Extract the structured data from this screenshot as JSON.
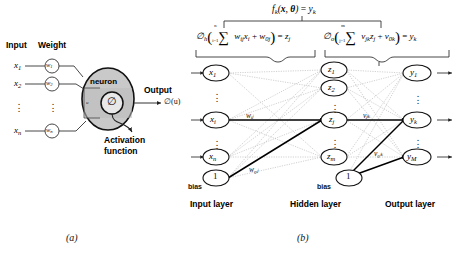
{
  "figure": {
    "panel_a": {
      "caption": "(a)",
      "headers": {
        "input": "Input",
        "weight": "Weight"
      },
      "inputs": [
        {
          "label": "x",
          "sub": "1"
        },
        {
          "label": "x",
          "sub": "2"
        },
        {
          "label": "x",
          "sub": "n"
        }
      ],
      "weights": [
        {
          "label": "w",
          "sub": "1"
        },
        {
          "label": "w",
          "sub": "2"
        },
        {
          "label": "w",
          "sub": "n"
        }
      ],
      "neuron_label": "neuron",
      "sum_symbol": "u",
      "activation_symbol": "∅",
      "output_header": "Output",
      "output_expr": "∅(u)",
      "activation_caption_line1": "Activation",
      "activation_caption_line2": "function",
      "vertical_dots": "⋮"
    },
    "panel_b": {
      "caption": "(b)",
      "top_formula": "fₖ(x, θ) = yₖ",
      "hidden_formula": "∅ₕ( Σ wᵢⱼxᵢ + w₀ⱼ ) = zⱼ",
      "output_formula": "∅ₒ( Σ vⱼₖzⱼ + v₀ₖ ) = yₖ",
      "hidden_sum_upper": "n",
      "hidden_sum_lower": "i=1",
      "output_sum_upper": "m",
      "output_sum_lower": "j=1",
      "layer_labels": {
        "input": "Input layer",
        "hidden": "Hidden layer",
        "output": "Output layer"
      },
      "bias_label": "bias",
      "bias_value": "1",
      "input_nodes": [
        {
          "label": "x",
          "sub": "1"
        },
        {
          "label": "x",
          "sub": "i"
        },
        {
          "label": "x",
          "sub": "n"
        }
      ],
      "hidden_nodes": [
        {
          "label": "z",
          "sub": "1"
        },
        {
          "label": "z",
          "sub": "2"
        },
        {
          "label": "z",
          "sub": "j"
        },
        {
          "label": "z",
          "sub": "m"
        }
      ],
      "output_nodes": [
        {
          "label": "y",
          "sub": "1"
        },
        {
          "label": "y",
          "sub": "k"
        },
        {
          "label": "y",
          "sub": "M"
        }
      ],
      "edge_weights": {
        "input_to_hidden": "wᵢⱼ",
        "input_bias_to_hidden": "w₀ⱼ",
        "hidden_to_output": "vⱼₖ",
        "hidden_bias_to_output": "v₀ₖ"
      },
      "vertical_dots": "⋮"
    }
  },
  "colors": {
    "ink": "#111111",
    "neuron_fill": "#c9c9c9",
    "neuron_inner_fill": "#e3e3e3",
    "line": "#444444",
    "dotted_line": "#999999",
    "bold_line": "#000000"
  }
}
